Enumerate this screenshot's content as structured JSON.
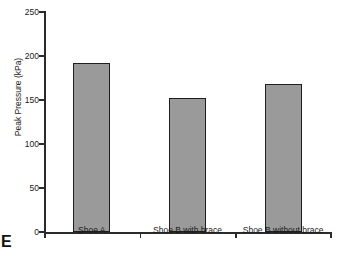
{
  "panel": {
    "letter": "E"
  },
  "chart_data": {
    "type": "bar",
    "title": "",
    "xlabel": "",
    "ylabel": "Peak Pressure (kPa)",
    "categories": [
      "Shoe A",
      "Shoe B with brace",
      "Shoe B without brace"
    ],
    "values": [
      192,
      152,
      168
    ],
    "ylim": [
      0,
      250
    ],
    "yticks": [
      0,
      50,
      100,
      150,
      200,
      250
    ],
    "ytick_labels": [
      "0",
      "50",
      "100",
      "150",
      "200",
      "250"
    ],
    "grid": false,
    "legend": null,
    "colors": {
      "bar_fill": "#9a9a9a",
      "bar_edge": "#1e1e1e",
      "axis": "#2b2b2b",
      "text": "#1a1a1a",
      "background": "#ffffff"
    }
  }
}
